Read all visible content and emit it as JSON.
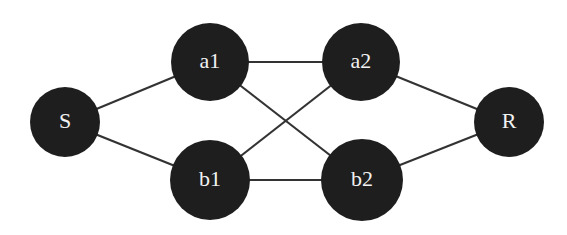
{
  "diagram": {
    "type": "network-graph",
    "nodes": [
      {
        "id": "S",
        "label": "S",
        "cx": 65,
        "cy": 122,
        "r": 35
      },
      {
        "id": "a1",
        "label": "a1",
        "cx": 210,
        "cy": 62,
        "r": 39
      },
      {
        "id": "b1",
        "label": "b1",
        "cx": 210,
        "cy": 180,
        "r": 40
      },
      {
        "id": "a2",
        "label": "a2",
        "cx": 361,
        "cy": 62,
        "r": 39
      },
      {
        "id": "b2",
        "label": "b2",
        "cx": 362,
        "cy": 180,
        "r": 41
      },
      {
        "id": "R",
        "label": "R",
        "cx": 509,
        "cy": 122,
        "r": 35
      }
    ],
    "edges": [
      {
        "from": "S",
        "to": "a1"
      },
      {
        "from": "S",
        "to": "b1"
      },
      {
        "from": "a1",
        "to": "a2"
      },
      {
        "from": "a1",
        "to": "b2"
      },
      {
        "from": "b1",
        "to": "a2"
      },
      {
        "from": "b1",
        "to": "b2"
      },
      {
        "from": "a2",
        "to": "R"
      },
      {
        "from": "b2",
        "to": "R"
      }
    ],
    "colors": {
      "node_fill": "#1e1e1e",
      "edge_stroke": "#333333",
      "label": "#f2f2f2",
      "background": "#ffffff"
    }
  }
}
